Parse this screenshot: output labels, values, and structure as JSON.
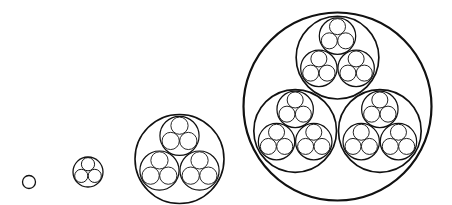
{
  "diagram": {
    "title": "",
    "stroke_color": "#111111",
    "background": "#ffffff",
    "child_radius_ratio": 0.44,
    "child_offset_ratio": 0.52,
    "figures": [
      {
        "id": "level-0",
        "cx": 29,
        "cy": 182,
        "r": 6.5,
        "depth": 0,
        "stroke_width": 1.3
      },
      {
        "id": "level-1",
        "cx": 88,
        "cy": 172,
        "r": 15,
        "depth": 1,
        "stroke_width": 1.3
      },
      {
        "id": "level-2",
        "cx": 179.5,
        "cy": 159,
        "r": 44.5,
        "depth": 2,
        "stroke_width": 1.6
      },
      {
        "id": "level-3",
        "cx": 337.5,
        "cy": 106.5,
        "r": 94,
        "depth": 3,
        "stroke_width": 2.2
      }
    ]
  }
}
